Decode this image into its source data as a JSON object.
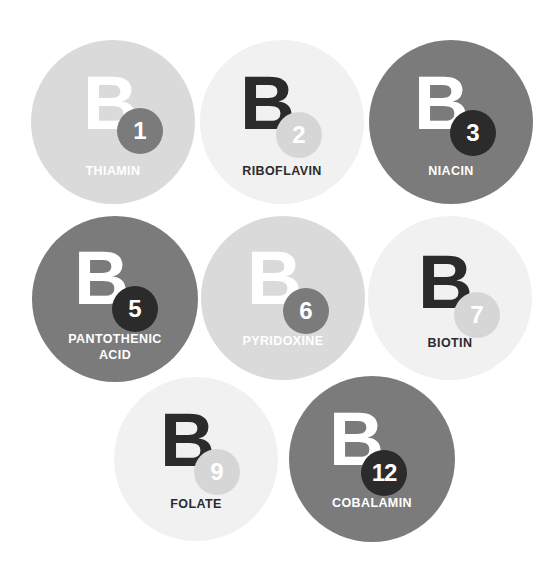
{
  "colors": {
    "light": "#dadada",
    "pale": "#f1f1f1",
    "mid": "#7b7b7b",
    "dark": "#2b2b2b",
    "white": "#ffffff",
    "sub_light": "#d6d6d6",
    "sub_mid": "#7b7b7b"
  },
  "vitamins": [
    {
      "letter": "B",
      "number": "1",
      "name": "THIAMIN"
    },
    {
      "letter": "B",
      "number": "2",
      "name": "RIBOFLAVIN"
    },
    {
      "letter": "B",
      "number": "3",
      "name": "NIACIN"
    },
    {
      "letter": "B",
      "number": "5",
      "name": "PANTOTHENIC",
      "name2": "ACID"
    },
    {
      "letter": "B",
      "number": "6",
      "name": "PYRIDOXINE"
    },
    {
      "letter": "B",
      "number": "7",
      "name": "BIOTIN"
    },
    {
      "letter": "B",
      "number": "9",
      "name": "FOLATE"
    },
    {
      "letter": "B",
      "number": "12",
      "name": "COBALAMIN"
    }
  ]
}
